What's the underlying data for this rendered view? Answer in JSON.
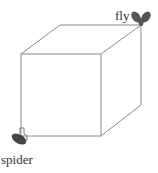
{
  "diagram": {
    "type": "cube-path-puzzle",
    "labels": {
      "fly": "fly",
      "spider": "spider"
    },
    "colors": {
      "edge": "#8a8a8a",
      "bug": "#555555",
      "text": "#333333"
    },
    "icons": {
      "fly": "fly-icon",
      "spider": "spider-icon"
    }
  }
}
